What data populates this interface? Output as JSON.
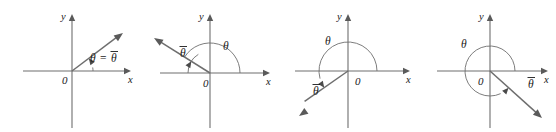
{
  "figure": {
    "width": 556,
    "height": 132,
    "background_color": "#ffffff",
    "line_color": "#6e6e6e",
    "label_color": "#1a1a1a",
    "axis_label_x": "x",
    "axis_label_y": "y",
    "origin_label": "0",
    "theta_symbol": "θ",
    "theta_bar_symbol": "θ",
    "equals_symbol": "="
  },
  "panels": [
    {
      "id": "panel-quadrant-1",
      "index": 1,
      "quadrant": "I",
      "origin": {
        "x": 72,
        "y": 71
      },
      "x_axis": {
        "x1": 23,
        "x2": 131,
        "y": 71
      },
      "y_axis": {
        "y1": 14,
        "y2": 128,
        "x": 72
      },
      "ray": {
        "angle_deg": 37,
        "length": 64,
        "tip_x": 123,
        "tip_y": 33
      },
      "theta_arc": {
        "radius": 21,
        "start_deg": 0,
        "end_deg": 37,
        "arrow": true
      },
      "theta_bar_arc": null,
      "labels": {
        "theta": {
          "text": "θ",
          "x": 90,
          "y": 62,
          "overbar": false
        },
        "equals": {
          "text": "=",
          "x": 100,
          "y": 62
        },
        "theta_bar": {
          "text": "θ",
          "x": 111,
          "y": 62,
          "overbar": true
        },
        "origin": {
          "text": "0",
          "x": 62,
          "y": 84
        },
        "x": {
          "text": "x",
          "x": 128,
          "y": 83
        },
        "y": {
          "text": "y",
          "x": 61,
          "y": 20
        }
      },
      "caption": "θ = θ̄ (angle in Quadrant I equals its reference angle)"
    },
    {
      "id": "panel-quadrant-2",
      "index": 2,
      "quadrant": "II",
      "origin": {
        "x": 210,
        "y": 73
      },
      "x_axis": {
        "x1": 160,
        "x2": 270,
        "y": 73
      },
      "y_axis": {
        "y1": 14,
        "y2": 128,
        "x": 210
      },
      "ray": {
        "angle_deg": 148,
        "length": 66,
        "tip_x": 154,
        "tip_y": 38
      },
      "theta_arc": {
        "radius": 30,
        "start_deg": 0,
        "end_deg": 148,
        "arrow": false
      },
      "theta_bar_arc": {
        "radius": 22,
        "start_deg": 180,
        "end_deg": 148,
        "arrow": true
      },
      "labels": {
        "theta": {
          "text": "θ",
          "x": 223,
          "y": 50,
          "overbar": false
        },
        "theta_bar": {
          "text": "θ",
          "x": 180,
          "y": 57,
          "overbar": true
        },
        "origin": {
          "text": "0",
          "x": 203,
          "y": 87
        },
        "x": {
          "text": "x",
          "x": 266,
          "y": 85
        },
        "y": {
          "text": "y",
          "x": 199,
          "y": 20
        }
      },
      "caption": "Quadrant II: θ measured from positive x-axis, θ̄ from negative x-axis"
    },
    {
      "id": "panel-quadrant-3",
      "index": 3,
      "quadrant": "III",
      "origin": {
        "x": 348,
        "y": 71
      },
      "x_axis": {
        "x1": 295,
        "x2": 410,
        "y": 71
      },
      "y_axis": {
        "y1": 14,
        "y2": 128,
        "x": 348
      },
      "ray": {
        "angle_deg": 215,
        "length": 60,
        "tip_x": 299,
        "tip_y": 116
      },
      "theta_arc": {
        "radius": 29,
        "start_deg": 0,
        "end_deg": 215,
        "arrow": true
      },
      "theta_bar_arc": null,
      "labels": {
        "theta": {
          "text": "θ",
          "x": 325,
          "y": 45,
          "overbar": false
        },
        "theta_bar": {
          "text": "θ",
          "x": 313,
          "y": 95,
          "overbar": true
        },
        "origin": {
          "text": "0",
          "x": 355,
          "y": 85
        },
        "x": {
          "text": "x",
          "x": 406,
          "y": 83
        },
        "y": {
          "text": "y",
          "x": 337,
          "y": 20
        }
      },
      "caption": "Quadrant III: θ sweeps past 180°, θ̄ is the reference angle below the negative x-axis"
    },
    {
      "id": "panel-quadrant-4",
      "index": 4,
      "quadrant": "IV",
      "origin": {
        "x": 490,
        "y": 71
      },
      "x_axis": {
        "x1": 437,
        "x2": 548,
        "y": 71
      },
      "y_axis": {
        "y1": 14,
        "y2": 128,
        "x": 490
      },
      "ray": {
        "angle_deg": 318,
        "length": 70,
        "tip_x": 542,
        "tip_y": 118
      },
      "theta_arc": {
        "radius": 25,
        "start_deg": 0,
        "end_deg": 318,
        "arrow": true
      },
      "theta_bar_arc": null,
      "labels": {
        "theta": {
          "text": "θ",
          "x": 461,
          "y": 48,
          "overbar": false
        },
        "theta_bar": {
          "text": "θ",
          "x": 528,
          "y": 88,
          "overbar": true
        },
        "origin": {
          "text": "0",
          "x": 478,
          "y": 85
        },
        "x": {
          "text": "x",
          "x": 544,
          "y": 83
        },
        "y": {
          "text": "y",
          "x": 479,
          "y": 20
        }
      },
      "caption": "Quadrant IV: θ is a nearly full revolution, θ̄ lies between the ray and the positive x-axis"
    }
  ]
}
